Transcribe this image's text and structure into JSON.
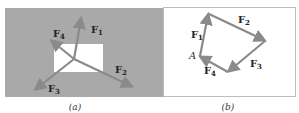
{
  "colors": {
    "panel_a_bg": "#a9a9a9",
    "panel_a_rect": "#ffffff",
    "panel_b_bg": "#ffffff",
    "panel_b_border": "#bdbdbd",
    "arrow": "#8a8a8a",
    "text": "#222222"
  },
  "panel_a": {
    "caption": "(a)",
    "forces": [
      {
        "id": "F1",
        "label": "F",
        "sub": "1"
      },
      {
        "id": "F2",
        "label": "F",
        "sub": "2"
      },
      {
        "id": "F3",
        "label": "F",
        "sub": "3"
      },
      {
        "id": "F4",
        "label": "F",
        "sub": "4"
      }
    ]
  },
  "panel_b": {
    "caption": "(b)",
    "point_label": "A",
    "forces": [
      {
        "id": "F1",
        "label": "F",
        "sub": "1"
      },
      {
        "id": "F2",
        "label": "F",
        "sub": "2"
      },
      {
        "id": "F3",
        "label": "F",
        "sub": "3"
      },
      {
        "id": "F4",
        "label": "F",
        "sub": "4"
      }
    ]
  }
}
